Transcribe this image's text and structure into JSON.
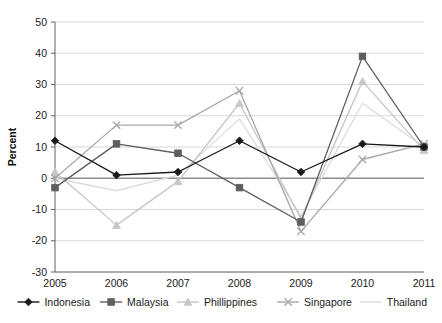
{
  "chart_data": {
    "type": "line",
    "title": "",
    "xlabel": "",
    "ylabel": "Percent",
    "categories": [
      2005,
      2006,
      2007,
      2008,
      2009,
      2010,
      2011
    ],
    "x_tick_labels": [
      "2005",
      "2006",
      "2007",
      "2008",
      "2009",
      "2010",
      "2011"
    ],
    "y_tick_labels": [
      "50",
      "40",
      "30",
      "20",
      "10",
      "0",
      "-10",
      "-20",
      "-30"
    ],
    "y_ticks": [
      50,
      40,
      30,
      20,
      10,
      0,
      -10,
      -20,
      -30
    ],
    "ylim": [
      -30,
      50
    ],
    "grid": true,
    "grid_axis": "y",
    "zero_line": true,
    "legend_position": "bottom",
    "series": [
      {
        "name": "Indonesia",
        "color": "#1a1a1a",
        "marker": "diamond",
        "values": [
          12,
          1,
          2,
          12,
          2,
          11,
          10
        ]
      },
      {
        "name": "Malaysia",
        "color": "#5e5e5e",
        "marker": "square",
        "values": [
          -3,
          11,
          8,
          -3,
          -14,
          39,
          10
        ]
      },
      {
        "name": "Phillippines",
        "color": "#c6c6c6",
        "marker": "triangle",
        "values": [
          2,
          -15,
          -1,
          24,
          -13,
          31,
          9
        ]
      },
      {
        "name": "Singapore",
        "color": "#a8a8a8",
        "marker": "cross",
        "values": [
          0,
          17,
          17,
          28,
          -17,
          6,
          11
        ]
      },
      {
        "name": "Thailand",
        "color": "#dcdcdc",
        "marker": "none",
        "values": [
          0,
          -4,
          1,
          19,
          -12,
          24,
          10
        ]
      }
    ]
  },
  "colors": {
    "background": "#ffffff",
    "axis": "#6e6e6e",
    "gridline": "#d4d4d4",
    "zero_line": "#8c8c8c",
    "text": "#1a1a1a"
  }
}
